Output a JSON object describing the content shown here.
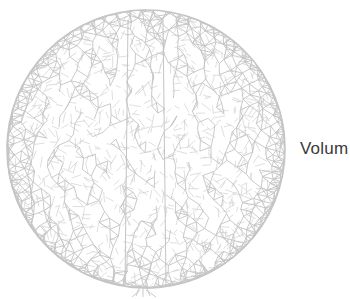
{
  "figure": {
    "mesh_color": "#c4c4c4",
    "background_color": "#ffffff",
    "label_text": "Volum",
    "label_color": "#3a3a3a"
  }
}
